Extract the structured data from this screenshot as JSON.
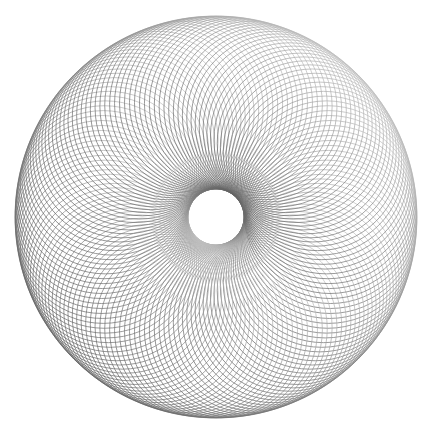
{
  "figure": {
    "type": "spirograph",
    "center": [
      216,
      217
    ],
    "outer_radius": 201,
    "inner_radius": 28,
    "circle_count": 144,
    "stroke_width": 0.7,
    "colors": {
      "background": "#ffffff",
      "stroke_dark": "#555555",
      "stroke_light": "#d8d8d8"
    }
  }
}
